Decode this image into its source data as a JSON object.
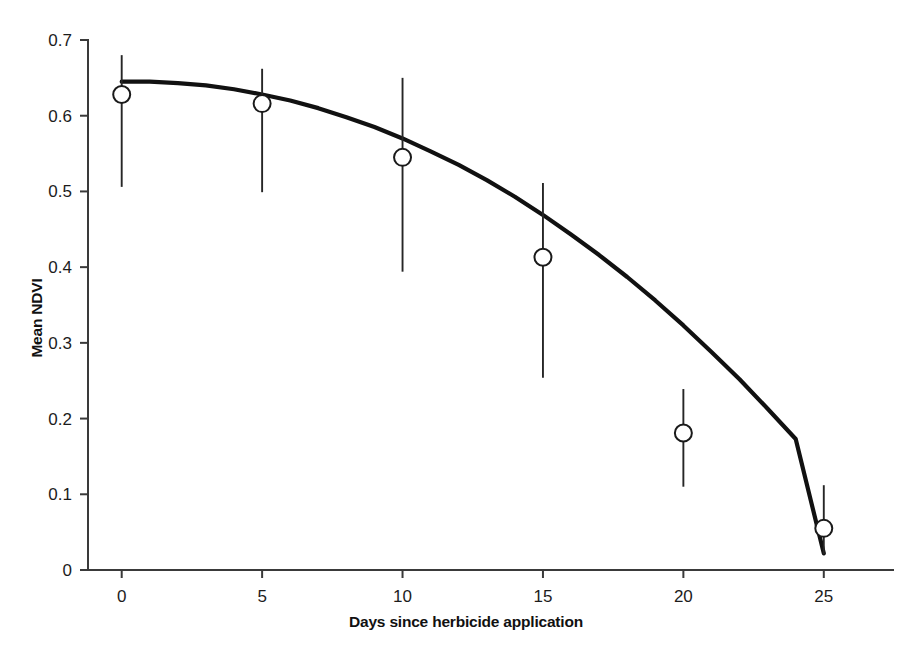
{
  "chart_data": {
    "type": "scatter",
    "title": "",
    "xlabel": "Days since herbicide application",
    "ylabel": "Mean NDVI",
    "xlim": [
      -1.2,
      27.5
    ],
    "ylim": [
      0,
      0.7
    ],
    "xticks": [
      0,
      5,
      10,
      15,
      20,
      25
    ],
    "xtick_labels": [
      "0",
      "5",
      "10",
      "15",
      "20",
      "25"
    ],
    "yticks": [
      0,
      0.1,
      0.2,
      0.3,
      0.4,
      0.5,
      0.6,
      0.7
    ],
    "ytick_labels": [
      "0",
      "0.1",
      "0.2",
      "0.3",
      "0.4",
      "0.5",
      "0.6",
      "0.7"
    ],
    "grid": false,
    "legend": null,
    "x": [
      0,
      5,
      10,
      15,
      20,
      25
    ],
    "values": [
      0.628,
      0.616,
      0.545,
      0.413,
      0.181,
      0.055
    ],
    "error_low": [
      0.506,
      0.499,
      0.394,
      0.254,
      0.11,
      0.021
    ],
    "error_high": [
      0.68,
      0.662,
      0.65,
      0.511,
      0.239,
      0.112
    ],
    "marker": "open-circle",
    "marker_face_color": "#ffffff",
    "marker_edge_color": "#1a1a1a",
    "fit_curve": {
      "label": "quadratic fit",
      "color": "#111111",
      "x": [
        0,
        1,
        2,
        3,
        4,
        5,
        6,
        7,
        8,
        9,
        10,
        11,
        12,
        13,
        14,
        15,
        16,
        17,
        18,
        19,
        20,
        21,
        22,
        23,
        24,
        25
      ],
      "y": [
        0.645,
        0.645,
        0.643,
        0.64,
        0.635,
        0.628,
        0.62,
        0.61,
        0.598,
        0.585,
        0.57,
        0.553,
        0.535,
        0.515,
        0.493,
        0.469,
        0.443,
        0.416,
        0.387,
        0.356,
        0.323,
        0.288,
        0.252,
        0.213,
        0.173,
        0.022
      ]
    }
  },
  "axes": {
    "x_axis_name": "x-axis",
    "y_axis_name": "y-axis"
  }
}
